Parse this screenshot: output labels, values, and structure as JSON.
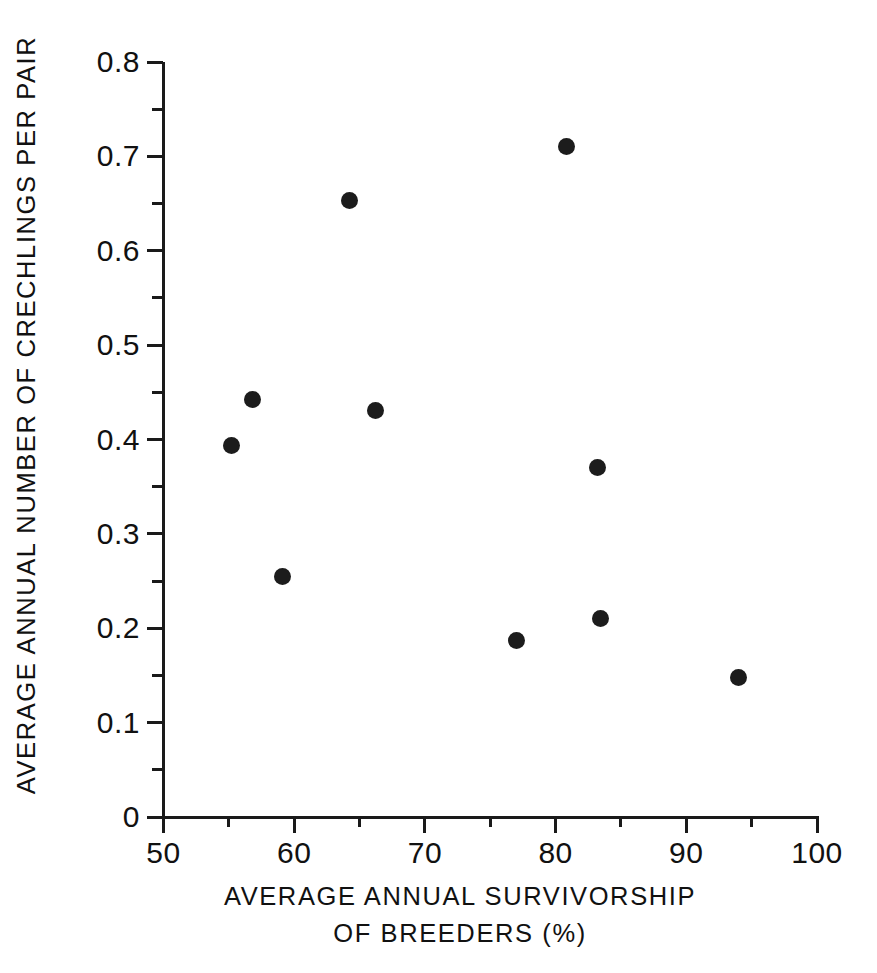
{
  "chart_data": {
    "type": "scatter",
    "title": "",
    "xlabel": "AVERAGE ANNUAL SURVIVORSHIP OF BREEDERS (%)",
    "xlabel_line1": "AVERAGE ANNUAL SURVIVORSHIP",
    "xlabel_line2": "OF BREEDERS (%)",
    "ylabel": "AVERAGE ANNUAL NUMBER OF CRECHLINGS PER PAIR",
    "xlim": [
      50,
      100
    ],
    "ylim": [
      0,
      0.8
    ],
    "grid": false,
    "legend": "none",
    "x_major_ticks": [
      50,
      60,
      70,
      80,
      90,
      100
    ],
    "x_minor_ticks": [
      55,
      65,
      75,
      85,
      95
    ],
    "x_tick_labels": [
      "50",
      "60",
      "70",
      "80",
      "90",
      "100"
    ],
    "y_major_ticks": [
      0,
      0.1,
      0.2,
      0.3,
      0.4,
      0.5,
      0.6,
      0.7,
      0.8
    ],
    "y_minor_ticks": [
      0.05,
      0.15,
      0.25,
      0.35,
      0.45,
      0.55,
      0.65,
      0.75
    ],
    "y_tick_labels": [
      "0",
      "0.1",
      "0.2",
      "0.3",
      "0.4",
      "0.5",
      "0.6",
      "0.7",
      "0.8"
    ],
    "marker": "filled-circle",
    "marker_color": "#1c1c1c",
    "points": [
      {
        "x": 55.2,
        "y": 0.394
      },
      {
        "x": 56.8,
        "y": 0.442
      },
      {
        "x": 59.1,
        "y": 0.255
      },
      {
        "x": 64.2,
        "y": 0.653
      },
      {
        "x": 66.2,
        "y": 0.431
      },
      {
        "x": 77.0,
        "y": 0.187
      },
      {
        "x": 80.8,
        "y": 0.71
      },
      {
        "x": 83.2,
        "y": 0.37
      },
      {
        "x": 83.4,
        "y": 0.21
      },
      {
        "x": 94.0,
        "y": 0.148
      }
    ]
  },
  "figure": {
    "background_color": "#ffffff",
    "axis_color": "#1a1a1a"
  }
}
